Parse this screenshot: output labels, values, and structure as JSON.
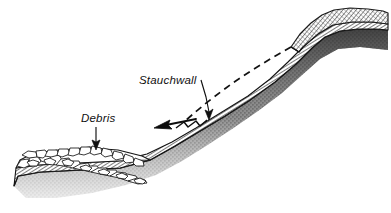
{
  "figure": {
    "domain": "Diagram",
    "kind": "geological-cross-section",
    "background_color": "#ffffff",
    "ink_color": "#101010",
    "width": 391,
    "height": 213
  },
  "labels": [
    {
      "id": "stauchwall",
      "text": "Stauchwall",
      "x": 139,
      "y": 84,
      "style": "italic",
      "font_size": 11.5,
      "leader": "diagonal-arrow-down-right"
    },
    {
      "id": "debris",
      "text": "Debris",
      "x": 81,
      "y": 122,
      "style": "italic",
      "font_size": 11.5,
      "leader": "vertical-arrow-down"
    }
  ],
  "annotations": {
    "movement_arrow": {
      "name": "movement-direction-arrow",
      "description": "solid arrow pointing down-slope to the left",
      "direction": "down-left"
    },
    "former_surface": {
      "name": "former-surface-dashed-line",
      "description": "dashed line marking the pre-failure ground surface",
      "style": "dashed"
    },
    "stauchwall_notch": {
      "name": "stauchwall-notch",
      "description": "stepped compression notch at the toe of the slope"
    }
  },
  "layers": [
    {
      "id": "debris-blocks",
      "name": "Debris",
      "texture": "angular-blocks",
      "fill": "#ffffff",
      "stroke": "#151515"
    },
    {
      "id": "hatched-band",
      "name": "Hatched displaced band",
      "texture": "fine-diagonal-hatch",
      "fill": "#fdfdfd",
      "stroke": "#141414"
    },
    {
      "id": "substrate",
      "name": "Stippled substrate",
      "texture": "stipple",
      "fill": "#8f8f8f",
      "stroke": "#2a2a2a"
    }
  ],
  "colors": {
    "ink": "#101010",
    "substrate_gray": "#8f8f8f",
    "substrate_dark": "#4a4a4a",
    "paper": "#ffffff"
  }
}
